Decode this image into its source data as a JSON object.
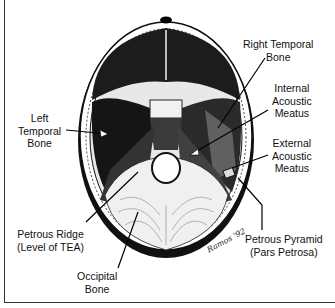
{
  "figure": {
    "colors": {
      "ink": "#111111",
      "background": "#ffffff",
      "bone_shade": "#2a2a2a"
    }
  },
  "labels": {
    "right_temporal_bone": [
      "Right Temporal",
      "Bone"
    ],
    "internal_acoustic_meatus": [
      "Internal",
      "Acoustic",
      "Meatus"
    ],
    "left_temporal_bone": [
      "Left",
      "Temporal",
      "Bone"
    ],
    "external_acoustic_meatus": [
      "External",
      "Acoustic",
      "Meatus"
    ],
    "petrous_ridge": [
      "Petrous Ridge",
      "(Level of TEA)"
    ],
    "petrous_pyramid": [
      "Petrous Pyramid",
      "(Pars Petrosa)"
    ],
    "occipital_bone": [
      "Occipital",
      "Bone"
    ]
  },
  "signature": "Ramos '92"
}
